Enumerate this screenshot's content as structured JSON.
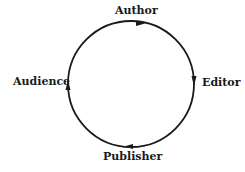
{
  "diagram": {
    "type": "cycle",
    "nodes": [
      {
        "id": "author",
        "label": "Author"
      },
      {
        "id": "editor",
        "label": "Editor"
      },
      {
        "id": "publisher",
        "label": "Publisher"
      },
      {
        "id": "audience",
        "label": "Audience"
      }
    ],
    "edges": [
      {
        "from": "Author",
        "to": "Editor"
      },
      {
        "from": "Editor",
        "to": "Publisher"
      },
      {
        "from": "Publisher",
        "to": "Audience"
      },
      {
        "from": "Audience",
        "to": "Author"
      }
    ],
    "direction": "clockwise",
    "stroke_color": "#1a1a1a"
  }
}
